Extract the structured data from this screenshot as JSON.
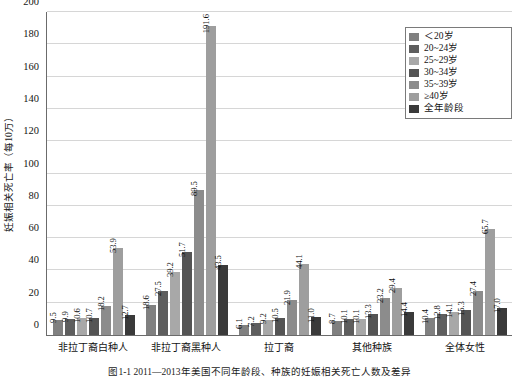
{
  "chart_data": {
    "type": "bar",
    "title": "",
    "xlabel": "",
    "ylabel": "妊娠相关死亡率（每10万）",
    "ylim": [
      0,
      200
    ],
    "ytick_step": 20,
    "yticks": [
      "0",
      "20",
      "40",
      "60",
      "80",
      "100",
      "120",
      "140",
      "160",
      "180",
      "200"
    ],
    "grid": true,
    "legend_position": "top-right",
    "categories": [
      "非拉丁裔白种人",
      "非拉丁裔黑种人",
      "拉丁裔",
      "其他种族",
      "全体女性"
    ],
    "series": [
      {
        "name": "＜20岁",
        "color": "#808080",
        "values": [
          9.5,
          18.6,
          6.1,
          8.7,
          10.4
        ]
      },
      {
        "name": "20~24岁",
        "color": "#5e5e5e",
        "values": [
          9.9,
          27.5,
          7.2,
          10.1,
          12.8
        ]
      },
      {
        "name": "25~29岁",
        "color": "#a8a8a8",
        "values": [
          10.6,
          39.2,
          9.2,
          10.1,
          14.1
        ]
      },
      {
        "name": "30~34岁",
        "color": "#545454",
        "values": [
          10.7,
          51.7,
          10.5,
          13.3,
          15.3
        ]
      },
      {
        "name": "35~39岁",
        "color": "#8c8c8c",
        "values": [
          18.2,
          89.5,
          21.9,
          23.2,
          27.4
        ]
      },
      {
        "name": "≥40岁",
        "color": "#9e9e9e",
        "values": [
          53.9,
          191.6,
          44.1,
          29.4,
          65.7
        ]
      },
      {
        "name": "全年龄段",
        "color": "#3a3a3a",
        "values": [
          12.7,
          43.5,
          11.0,
          14.4,
          17.0
        ]
      }
    ]
  },
  "legend": {
    "items": [
      {
        "label": "＜20岁"
      },
      {
        "label": "20~24岁"
      },
      {
        "label": "25~29岁"
      },
      {
        "label": "30~34岁"
      },
      {
        "label": "35~39岁"
      },
      {
        "label": "≥40岁"
      },
      {
        "label": "全年龄段"
      }
    ]
  },
  "caption": "图1-1  2011—2013年美国不同年龄段、种族的妊娠相关死亡人数及差异"
}
